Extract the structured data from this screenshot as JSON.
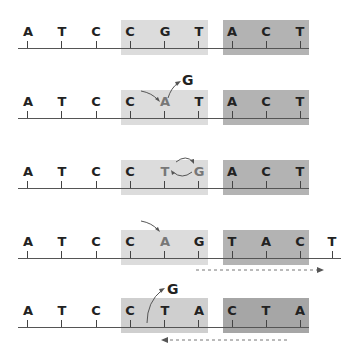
{
  "colors": {
    "light_box": "#dcdcdc",
    "dark_box": "#b3b3b3",
    "strand": "#555555",
    "text": "#222222",
    "arrow": "#555555"
  },
  "rows": [
    {
      "step": 1,
      "bases": [
        "A",
        "T",
        "C",
        "C",
        "G",
        "T",
        "A",
        "C",
        "T"
      ],
      "annotation": "",
      "description": "Original sequence with target region (CGT) and adjacent region (ACT) shaded"
    },
    {
      "step": 2,
      "bases": [
        "A",
        "T",
        "C",
        "C",
        "A",
        "T",
        "A",
        "C",
        "T"
      ],
      "annotation": "G",
      "description": "G replaced by A; G removed (arrow out)"
    },
    {
      "step": 3,
      "bases": [
        "A",
        "T",
        "C",
        "C",
        "T",
        "G",
        "A",
        "C",
        "T"
      ],
      "annotation": "",
      "description": "T and G swapped (circular arrows)"
    },
    {
      "step": 4,
      "bases": [
        "A",
        "T",
        "C",
        "C",
        "A",
        "G",
        "T",
        "A",
        "C",
        "T"
      ],
      "annotation": "",
      "description": "A inserted; downstream sequence shifted right (dashed arrow)"
    },
    {
      "step": 5,
      "bases": [
        "A",
        "T",
        "C",
        "C",
        "T",
        "A",
        "C",
        "T",
        "A"
      ],
      "annotation": "G",
      "description": "G deleted; downstream sequence shifted left (dashed arrow)"
    }
  ]
}
